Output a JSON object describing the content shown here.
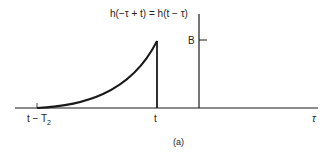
{
  "figure": {
    "function_label": "h(−τ + t) = h(t − τ)",
    "y_tick_label": "B",
    "x_labels": {
      "start": "t − T",
      "start_sub": "2",
      "peak": "t",
      "axis": "τ"
    },
    "caption": "(a)"
  },
  "colors": {
    "line": "#1a1a1a",
    "background": "#ffffff"
  }
}
